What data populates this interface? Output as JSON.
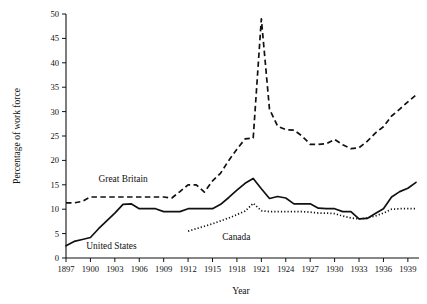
{
  "chart_data": {
    "type": "line",
    "title": "",
    "xlabel": "Year",
    "ylabel": "Percentage of work force",
    "xlim": [
      1897,
      1940
    ],
    "ylim": [
      0,
      50
    ],
    "grid": false,
    "legend_position": "inline-annotations",
    "x_ticks": [
      1897,
      1900,
      1903,
      1906,
      1909,
      1912,
      1915,
      1918,
      1921,
      1924,
      1927,
      1930,
      1933,
      1936,
      1939
    ],
    "y_ticks": [
      0,
      5,
      10,
      15,
      20,
      25,
      30,
      35,
      40,
      45,
      50
    ],
    "series": [
      {
        "name": "Great Britain",
        "style": "dashed",
        "label_x": 1901.0,
        "label_y": 15.6,
        "x": [
          1897,
          1898,
          1899,
          1900,
          1901,
          1902,
          1903,
          1904,
          1905,
          1906,
          1907,
          1908,
          1909,
          1910,
          1911,
          1912,
          1913,
          1914,
          1915,
          1916,
          1917,
          1918,
          1919,
          1920,
          1921,
          1922,
          1923,
          1924,
          1925,
          1926,
          1927,
          1928,
          1929,
          1930,
          1931,
          1932,
          1933,
          1934,
          1935,
          1936,
          1937,
          1938,
          1939,
          1940
        ],
        "y": [
          11.3,
          11.3,
          11.6,
          12.5,
          12.5,
          12.5,
          12.5,
          12.5,
          12.5,
          12.5,
          12.5,
          12.5,
          12.5,
          12.3,
          13.6,
          15.0,
          15.0,
          13.5,
          15.8,
          17.4,
          20.0,
          22.3,
          24.4,
          24.6,
          49.0,
          30.5,
          27.0,
          26.3,
          26.2,
          25.0,
          23.3,
          23.3,
          23.4,
          24.3,
          23.2,
          22.4,
          22.6,
          23.9,
          25.6,
          26.9,
          29.1,
          30.5,
          32.0,
          33.4
        ]
      },
      {
        "name": "United States",
        "style": "solid",
        "label_x": 1899.5,
        "label_y": 1.8,
        "x": [
          1897,
          1898,
          1899,
          1900,
          1901,
          1902,
          1903,
          1904,
          1905,
          1906,
          1907,
          1908,
          1909,
          1910,
          1911,
          1912,
          1913,
          1914,
          1915,
          1916,
          1917,
          1918,
          1919,
          1920,
          1921,
          1922,
          1923,
          1924,
          1925,
          1926,
          1927,
          1928,
          1929,
          1930,
          1931,
          1932,
          1933,
          1934,
          1935,
          1936,
          1937,
          1938,
          1939,
          1940
        ],
        "y": [
          2.5,
          3.4,
          3.8,
          4.2,
          6.0,
          7.6,
          9.2,
          11.0,
          11.1,
          10.1,
          10.1,
          10.1,
          9.5,
          9.5,
          9.5,
          10.1,
          10.1,
          10.1,
          10.1,
          11.0,
          12.4,
          13.9,
          15.3,
          16.3,
          14.2,
          12.2,
          12.6,
          12.3,
          11.1,
          11.1,
          11.1,
          10.2,
          10.1,
          10.1,
          9.5,
          9.5,
          8.0,
          8.1,
          9.1,
          10.1,
          12.5,
          13.6,
          14.3,
          15.5
        ]
      },
      {
        "name": "Canada",
        "style": "dotted",
        "label_x": 1916.2,
        "label_y": 3.6,
        "x": [
          1912,
          1913,
          1914,
          1915,
          1916,
          1917,
          1918,
          1919,
          1920,
          1921,
          1922,
          1923,
          1924,
          1925,
          1926,
          1927,
          1928,
          1929,
          1930,
          1931,
          1932,
          1933,
          1934,
          1935,
          1936,
          1937,
          1938,
          1939,
          1940
        ],
        "y": [
          5.5,
          6.0,
          6.5,
          7.0,
          7.6,
          8.2,
          8.9,
          9.6,
          11.2,
          9.7,
          9.5,
          9.5,
          9.5,
          9.5,
          9.5,
          9.4,
          9.2,
          9.2,
          9.1,
          8.6,
          8.2,
          8.0,
          8.2,
          8.6,
          9.2,
          10.0,
          10.1,
          10.1,
          10.1
        ]
      }
    ]
  }
}
